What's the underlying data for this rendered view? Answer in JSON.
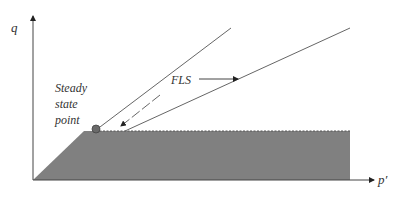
{
  "diagram": {
    "axes": {
      "y_label": "q",
      "x_label": "p′"
    },
    "labels": {
      "steady_state_lines": [
        "Steady",
        "state",
        "point"
      ],
      "fls": "FLS"
    },
    "colors": {
      "shaded_region": "#7f7f7f",
      "lines": "#555555",
      "point": "#666666"
    }
  }
}
